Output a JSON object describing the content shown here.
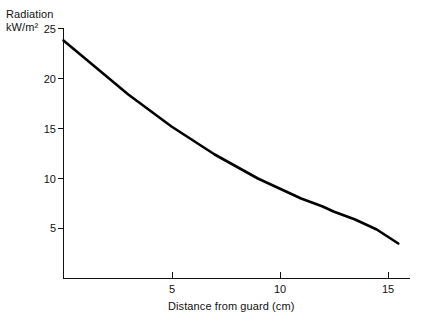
{
  "chart_data": {
    "type": "line",
    "title": "",
    "subtitle": "",
    "ylabel_line1": "Radiation",
    "ylabel_line2": "kW/m²",
    "xlabel": "Distance from guard (cm)",
    "xlim": [
      0,
      16.0
    ],
    "ylim": [
      0,
      26.0
    ],
    "xticks": [
      5,
      10,
      15
    ],
    "xtick_labels": [
      "5",
      "10",
      "15"
    ],
    "yticks": [
      5,
      10,
      15,
      20,
      25
    ],
    "ytick_labels": [
      "5",
      "10",
      "15",
      "20",
      "25"
    ],
    "grid": false,
    "legend": "none",
    "series": [
      {
        "name": "Radiation vs distance",
        "color": "#000000",
        "x": [
          0.0,
          0.5,
          1.0,
          1.5,
          2.0,
          2.5,
          3.0,
          3.5,
          4.0,
          4.5,
          5.0,
          5.5,
          6.0,
          6.5,
          7.0,
          7.5,
          8.0,
          8.5,
          9.0,
          9.5,
          10.0,
          10.5,
          11.0,
          11.5,
          12.0,
          12.5,
          13.0,
          13.5,
          14.0,
          14.5,
          15.0,
          15.5
        ],
        "values": [
          23.8,
          22.9,
          22.0,
          21.1,
          20.2,
          19.3,
          18.4,
          17.6,
          16.8,
          16.0,
          15.2,
          14.5,
          13.8,
          13.1,
          12.4,
          11.8,
          11.2,
          10.6,
          10.0,
          9.5,
          9.0,
          8.5,
          8.0,
          7.6,
          7.2,
          6.7,
          6.3,
          5.9,
          5.4,
          4.9,
          4.2,
          3.5
        ]
      }
    ],
    "axis_color": "#111111",
    "line_color": "#000000",
    "background_color": "#ffffff"
  },
  "axes": {
    "ytick_values": [
      {
        "label": "25"
      },
      {
        "label": "20"
      },
      {
        "label": "15"
      },
      {
        "label": "10"
      },
      {
        "label": "5"
      }
    ],
    "xtick_values": [
      {
        "label": "5"
      },
      {
        "label": "10"
      },
      {
        "label": "15"
      }
    ]
  }
}
